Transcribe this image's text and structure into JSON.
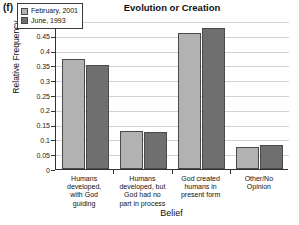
{
  "panel": {
    "label": "(f)"
  },
  "chart_data": {
    "type": "bar",
    "title": "Evolution or Creation",
    "xlabel": "Belief",
    "ylabel": "Relative Frequency",
    "categories": [
      "Humans developed, with God guiding",
      "Humans developed, but God had no part in process",
      "God created humans in present form",
      "Other/No Opinion"
    ],
    "category_lines": [
      [
        "Humans",
        "developed,",
        "with God",
        "guiding"
      ],
      [
        "Humans",
        "developed, but",
        "God had no",
        "part in process"
      ],
      [
        "God created",
        "humans in",
        "present form"
      ],
      [
        "Other/No",
        "Opinion"
      ]
    ],
    "series": [
      {
        "name": "February, 2001",
        "color": "#b2b2b2",
        "values": [
          0.37,
          0.13,
          0.46,
          0.075
        ]
      },
      {
        "name": "June, 1993",
        "color": "#6f6f6f",
        "values": [
          0.35,
          0.125,
          0.475,
          0.08
        ]
      }
    ],
    "ylim": [
      0,
      0.5
    ],
    "yticks": [
      0,
      0.05,
      0.1,
      0.15,
      0.2,
      0.25,
      0.3,
      0.35,
      0.4,
      0.45,
      0.5
    ],
    "ytick_labels": [
      "0",
      "0.05",
      "0.1",
      "0.15",
      "0.2",
      "0.25",
      "0.3",
      "0.35",
      "0.4",
      "0.45",
      "0.5"
    ],
    "grid": true,
    "legend_position": "upper-left"
  }
}
